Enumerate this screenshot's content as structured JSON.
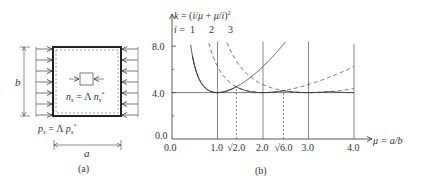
{
  "figure_a": {
    "caption": "(a)",
    "dim_b_label": "b",
    "dim_a_label": "a",
    "load_label": "p_x = Λ p_x*",
    "load_label_parts": {
      "p": "p",
      "sub_x": "x",
      "eq": " = Λ ",
      "p2": "p",
      "sub_x2": "x",
      "sup": "*"
    },
    "inner_label_parts": {
      "n": "n",
      "sub_x": "x",
      "eq": " = Λ ",
      "n2": "n",
      "sub_x2": "x",
      "sup": "*"
    },
    "arrow_count_per_side": 7
  },
  "figure_b": {
    "caption": "(b)"
  },
  "chart_data": {
    "type": "line",
    "xlabel": "μ = a/b",
    "ylabel": "k = (i/μ + μ/i)²",
    "xlim": [
      0.0,
      4.0
    ],
    "ylim": [
      0.0,
      8.0
    ],
    "x_ticks": [
      "0.0",
      "1.0",
      "√2.0",
      "2.0",
      "√6.0",
      "3.0",
      "4.0"
    ],
    "x_tick_values": [
      0.0,
      1.0,
      1.414,
      2.0,
      2.449,
      3.0,
      4.0
    ],
    "y_ticks": [
      "0.0",
      "4.0",
      "8.0"
    ],
    "y_tick_values": [
      0.0,
      4.0,
      8.0
    ],
    "series_label_prefix": "i = ",
    "series": [
      {
        "name": "i = 1",
        "label": "1",
        "i": 1,
        "style": "solid",
        "x": [
          0.45,
          0.5,
          0.6,
          0.7,
          0.8,
          0.9,
          1.0,
          1.1,
          1.2,
          1.3,
          1.414
        ],
        "values": [
          6.66,
          6.25,
          5.14,
          4.53,
          4.2,
          4.03,
          4.0,
          4.04,
          4.14,
          4.28,
          4.5
        ]
      },
      {
        "name": "i = 2",
        "label": "2",
        "i": 2,
        "style": "dashed",
        "x": [
          0.9,
          1.0,
          1.2,
          1.414,
          1.6,
          1.8,
          2.0,
          2.2,
          2.449,
          2.8,
          3.2,
          3.6,
          4.0
        ],
        "values": [
          8.0,
          6.25,
          5.14,
          4.5,
          4.22,
          4.05,
          4.0,
          4.03,
          4.17,
          4.53,
          5.14,
          5.81,
          6.25
        ]
      },
      {
        "name": "i = 3",
        "label": "3",
        "i": 3,
        "style": "dashed",
        "x": [
          1.5,
          1.8,
          2.0,
          2.449,
          2.7,
          3.0,
          3.3,
          3.6,
          4.0
        ],
        "values": [
          8.0,
          6.55,
          5.84,
          4.67,
          4.26,
          4.0,
          4.04,
          4.17,
          4.34
        ]
      }
    ],
    "envelope": {
      "style": "solid",
      "description": "lower envelope approaching k = 4"
    },
    "reference_line": {
      "y": 4.0,
      "style": "solid"
    },
    "vertical_lines_solid": [
      1.0,
      2.0,
      3.0,
      4.0
    ],
    "vertical_lines_dashed": [
      1.414,
      2.449
    ],
    "grid": false
  }
}
